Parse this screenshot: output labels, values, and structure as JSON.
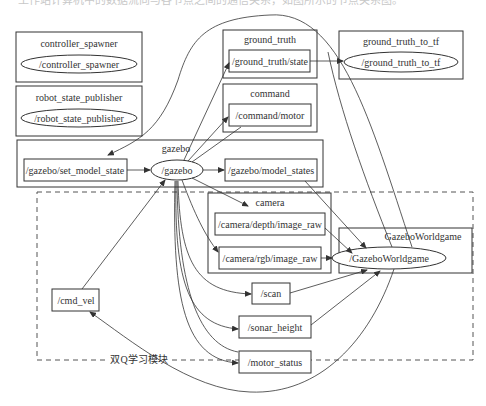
{
  "top_caption_clipped": "工作站计算机中的数据流向与各节点之间的通信关系，如图所示的节点关系图。",
  "clusters": {
    "controller_spawner": {
      "label": "controller_spawner",
      "node": "/controller_spawner"
    },
    "robot_state_publisher": {
      "label": "robot_state_publisher",
      "node": "/robot_state_publisher"
    },
    "ground_truth": {
      "label": "ground_truth",
      "topic": "/ground_truth/state"
    },
    "ground_truth_to_tf": {
      "label": "ground_truth_to_tf",
      "node": "/ground_truth_to_tf"
    },
    "command": {
      "label": "command",
      "topic": "/command/motor"
    },
    "gazebo": {
      "label": "gazebo",
      "topic_in": "/gazebo/set_model_state",
      "node": "/gazebo",
      "topic_out": "/gazebo/model_states"
    },
    "camera": {
      "label": "camera",
      "depth": "/camera/depth/image_raw",
      "rgb": "/camera/rgb/image_raw"
    },
    "gazebo_worldgame": {
      "label": "GazeboWorldgame",
      "node": "/GazeboWorldgame"
    }
  },
  "topics": {
    "cmd_vel": "/cmd_vel",
    "scan": "/scan",
    "sonar_height": "/sonar_height",
    "motor_status": "/motor_status"
  },
  "module_label": "双Q学习模块",
  "colors": {
    "stroke": "#333333",
    "background": "#ffffff",
    "dashed": "#555555"
  }
}
